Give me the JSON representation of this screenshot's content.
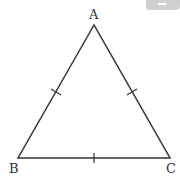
{
  "diagram": {
    "type": "equilateral-triangle",
    "vertices": [
      {
        "label": "A",
        "x": 94,
        "y": 25
      },
      {
        "label": "B",
        "x": 18,
        "y": 158
      },
      {
        "label": "C",
        "x": 170,
        "y": 158
      }
    ],
    "tick_marks": [
      "AB",
      "AC",
      "BC"
    ],
    "stroke_color": "#333333",
    "tab_color": "#cfcfcf"
  }
}
